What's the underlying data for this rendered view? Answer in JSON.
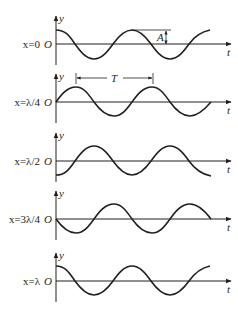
{
  "figure": {
    "title": "",
    "axis_labels": {
      "vertical": "y",
      "horizontal": "t",
      "origin": "O"
    },
    "colors": {
      "ink": "#231f20",
      "background": "#ffffff"
    },
    "panels": [
      {
        "label": "x=0",
        "phase": "cos",
        "baseline_y": 44,
        "annotation": "A"
      },
      {
        "label": "x=λ/4",
        "phase": "sin",
        "baseline_y": 102,
        "annotation": "T"
      },
      {
        "label": "x=λ/2",
        "phase": "-cos",
        "baseline_y": 161
      },
      {
        "label": "x=3λ/4",
        "phase": "-sin",
        "baseline_y": 219
      },
      {
        "label": "x=λ",
        "phase": "cos",
        "baseline_y": 281
      }
    ],
    "annotations": {
      "amplitude": "A",
      "period": "T"
    }
  }
}
